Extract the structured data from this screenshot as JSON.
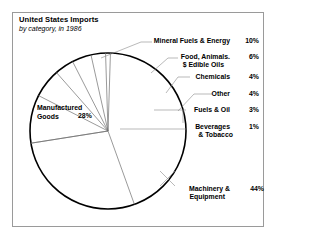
{
  "chart": {
    "title": "United States Imports",
    "subtitle": "by category, in 1986"
  },
  "chart_data": {
    "type": "pie",
    "title": "United States Imports",
    "subtitle": "by category, in 1986",
    "xlabel": "",
    "ylabel": "",
    "legend_position": "callout-labels",
    "grid": false,
    "categories": [
      "Mineral Fuels & Energy",
      "Food, Animals. $ Edible Oils",
      "Chemicals",
      "Other",
      "Fuels & Oil",
      "Beverages & Tobacco",
      "Machinery & Equipment",
      "Manufactured Goods"
    ],
    "values": [
      10,
      6,
      4,
      4,
      3,
      1,
      44,
      28
    ],
    "value_labels": [
      "10%",
      "6%",
      "4%",
      "4%",
      "3%",
      "1%",
      "44%",
      "28%"
    ],
    "colors": [
      "#ffffff",
      "#ffffff",
      "#ffffff",
      "#ffffff",
      "#ffffff",
      "#ffffff",
      "#ffffff",
      "#ffffff"
    ],
    "outline_color": "#000000"
  },
  "callouts": {
    "mineral": {
      "label": "Mineral Fuels & Energy",
      "pct": "10%"
    },
    "food": {
      "label_line1": "Food, Animals.",
      "label_line2": "$ Edible Oils",
      "pct": "6%"
    },
    "chemicals": {
      "label": "Chemicals",
      "pct": "4%"
    },
    "other": {
      "label": "Other",
      "pct": "4%"
    },
    "fuels": {
      "label": "Fuels & Oil",
      "pct": "3%"
    },
    "beverages": {
      "label_line1": "Beverages",
      "label_line2": "& Tobacco",
      "pct": "1%"
    },
    "machinery": {
      "label_line1": "Machinery &",
      "label_line2": "Equipment",
      "pct": "44%"
    },
    "manufactured": {
      "label_line1": "Manufactured",
      "label_line2": "Goods",
      "pct": "28%"
    }
  }
}
